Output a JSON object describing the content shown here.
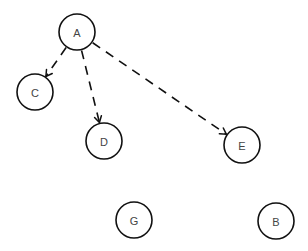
{
  "diagram": {
    "type": "directed-graph",
    "width": 308,
    "height": 251,
    "node_radius": 18,
    "colors": {
      "background": "#ffffff",
      "stroke": "#111111",
      "label": "#444444"
    },
    "nodes": [
      {
        "id": "A",
        "label": "A",
        "x": 77,
        "y": 32
      },
      {
        "id": "C",
        "label": "C",
        "x": 35,
        "y": 92
      },
      {
        "id": "D",
        "label": "D",
        "x": 104,
        "y": 141
      },
      {
        "id": "E",
        "label": "E",
        "x": 242,
        "y": 145
      },
      {
        "id": "G",
        "label": "G",
        "x": 134,
        "y": 220
      },
      {
        "id": "B",
        "label": "B",
        "x": 276,
        "y": 221
      }
    ],
    "edges": [
      {
        "from": "A",
        "to": "C",
        "style": "dashed",
        "directed": true
      },
      {
        "from": "A",
        "to": "D",
        "style": "dashed",
        "directed": true
      },
      {
        "from": "A",
        "to": "E",
        "style": "dashed",
        "directed": true
      }
    ]
  }
}
